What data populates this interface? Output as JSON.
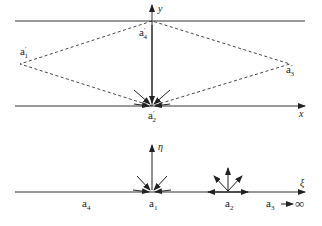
{
  "diagram": {
    "upper_plane": {
      "x_axis_label": "x",
      "y_axis_label": "y",
      "points": [
        {
          "id": "a1p",
          "base": "a",
          "prime": "′",
          "sub": "1"
        },
        {
          "id": "a2p",
          "base": "a",
          "prime": "′",
          "sub": "2"
        },
        {
          "id": "a3p",
          "base": "a",
          "prime": "′",
          "sub": "3"
        },
        {
          "id": "a4p",
          "base": "a",
          "prime": "′",
          "sub": "4"
        }
      ]
    },
    "lower_plane": {
      "xi_axis_label": "ξ",
      "eta_axis_label": "η",
      "points": [
        {
          "id": "a4",
          "base": "a",
          "sub": "4"
        },
        {
          "id": "a1",
          "base": "a",
          "sub": "1"
        },
        {
          "id": "a2",
          "base": "a",
          "sub": "2"
        },
        {
          "id": "a3",
          "base": "a",
          "sub": "3"
        }
      ],
      "infinity_symbol": "∞"
    },
    "colors": {
      "line": "#333333",
      "background": "#ffffff"
    }
  }
}
